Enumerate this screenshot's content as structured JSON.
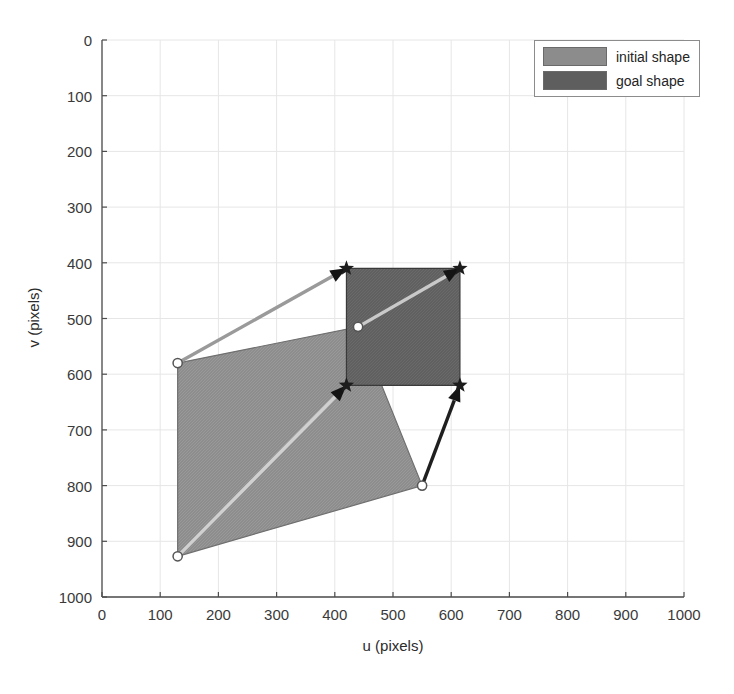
{
  "chart_data": {
    "type": "scatter",
    "title": "",
    "xlabel": "u (pixels)",
    "ylabel": "v (pixels)",
    "xlim": [
      0,
      1000
    ],
    "ylim": [
      0,
      1000
    ],
    "y_inverted": true,
    "grid": true,
    "xticks": [
      0,
      100,
      200,
      300,
      400,
      500,
      600,
      700,
      800,
      900,
      1000
    ],
    "yticks": [
      0,
      100,
      200,
      300,
      400,
      500,
      600,
      700,
      800,
      900,
      1000
    ],
    "legend": {
      "position": "top-right",
      "entries": [
        {
          "label": "initial shape",
          "color": "#8c8c8c"
        },
        {
          "label": "goal shape",
          "color": "#5e5e5e"
        }
      ]
    },
    "series": [
      {
        "name": "initial shape",
        "type": "polygon",
        "fill": "#8c8c8c",
        "edge": "#6f6f6f",
        "marker": "circle",
        "points": [
          {
            "u": 130,
            "v": 580
          },
          {
            "u": 440,
            "v": 515
          },
          {
            "u": 550,
            "v": 800
          },
          {
            "u": 130,
            "v": 927
          }
        ]
      },
      {
        "name": "goal shape",
        "type": "polygon",
        "fill": "#5e5e5e",
        "edge": "#3a3a3a",
        "marker": "star",
        "points": [
          {
            "u": 420,
            "v": 410
          },
          {
            "u": 615,
            "v": 410
          },
          {
            "u": 615,
            "v": 620
          },
          {
            "u": 420,
            "v": 620
          }
        ]
      }
    ],
    "arrows": [
      {
        "name": "arrow-topleft",
        "from": {
          "u": 130,
          "v": 580
        },
        "to": {
          "u": 420,
          "v": 410
        },
        "color": "#9a9a9a"
      },
      {
        "name": "arrow-topright",
        "from": {
          "u": 440,
          "v": 515
        },
        "to": {
          "u": 615,
          "v": 410
        },
        "color": "#c9c9c9"
      },
      {
        "name": "arrow-bottomleft",
        "from": {
          "u": 130,
          "v": 927
        },
        "to": {
          "u": 420,
          "v": 620
        },
        "color": "#d0d0d0"
      },
      {
        "name": "arrow-bottomright",
        "from": {
          "u": 550,
          "v": 800
        },
        "to": {
          "u": 615,
          "v": 620
        },
        "color": "#1f1f1f"
      }
    ]
  },
  "axes": {
    "xlabel": "u (pixels)",
    "ylabel": "v (pixels)",
    "xticks": [
      "0",
      "100",
      "200",
      "300",
      "400",
      "500",
      "600",
      "700",
      "800",
      "900",
      "1000"
    ],
    "yticks": [
      "0",
      "100",
      "200",
      "300",
      "400",
      "500",
      "600",
      "700",
      "800",
      "900",
      "1000"
    ]
  },
  "legend": {
    "initial_label": "initial shape",
    "goal_label": "goal shape"
  }
}
